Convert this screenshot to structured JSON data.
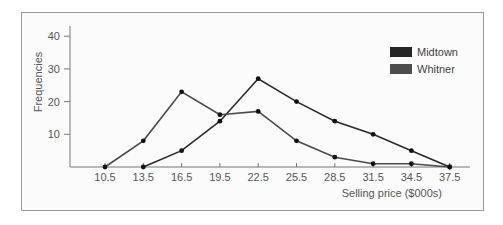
{
  "chart_data": {
    "type": "line",
    "title": "",
    "xlabel": "Selling price ($000s)",
    "ylabel": "Frequencies",
    "x": [
      10.5,
      13.5,
      16.5,
      19.5,
      22.5,
      25.5,
      28.5,
      31.5,
      34.5,
      37.5
    ],
    "x_tick_labels": [
      "10.5",
      "13.5",
      "16.5",
      "19.5",
      "22.5",
      "25.5",
      "28.5",
      "31.5",
      "34.5",
      "37.5"
    ],
    "y_ticks": [
      10,
      20,
      30,
      40
    ],
    "y_tick_labels": [
      "10",
      "20",
      "30",
      "40"
    ],
    "ylim": [
      0,
      40
    ],
    "grid": false,
    "legend_position": "upper right",
    "series": [
      {
        "name": "Midtown",
        "color": "#2a2a2a",
        "x": [
          13.5,
          16.5,
          19.5,
          22.5,
          25.5,
          28.5,
          31.5,
          34.5,
          37.5
        ],
        "values": [
          0,
          5,
          14,
          27,
          20,
          14,
          10,
          5,
          0
        ]
      },
      {
        "name": "Whitner",
        "color": "#4a4a4a",
        "x": [
          10.5,
          13.5,
          16.5,
          19.5,
          22.5,
          25.5,
          28.5,
          31.5,
          34.5,
          37.5
        ],
        "values": [
          0,
          8,
          23,
          16,
          17,
          8,
          3,
          1,
          1,
          0
        ]
      }
    ]
  },
  "legend": {
    "items": [
      {
        "label": "Midtown",
        "color": "#262626"
      },
      {
        "label": "Whitner",
        "color": "#4d4d4d"
      }
    ]
  }
}
